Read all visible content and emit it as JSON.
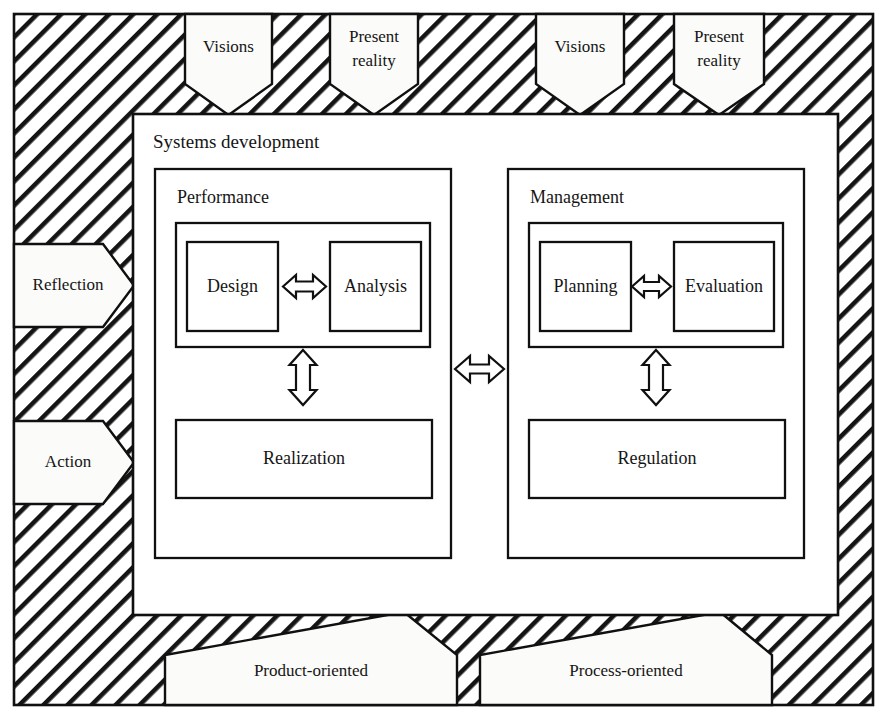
{
  "diagram": {
    "title": "Systems development",
    "outer_frame": {
      "name": "hatched-context-frame"
    },
    "columns": [
      {
        "heading": "Performance",
        "pair": {
          "left": "Design",
          "right": "Analysis"
        },
        "lower": "Realization",
        "bottom_arrow": "Product-oriented"
      },
      {
        "heading": "Management",
        "pair": {
          "left": "Planning",
          "right": "Evaluation"
        },
        "lower": "Regulation",
        "bottom_arrow": "Process-oriented"
      }
    ],
    "top_arrows": [
      {
        "label": "Visions",
        "lines": [
          "Visions"
        ]
      },
      {
        "label": "Present reality",
        "lines": [
          "Present",
          "reality"
        ]
      },
      {
        "label": "Visions",
        "lines": [
          "Visions"
        ]
      },
      {
        "label": "Present reality",
        "lines": [
          "Present",
          "reality"
        ]
      }
    ],
    "left_arrows": [
      {
        "label": "Reflection"
      },
      {
        "label": "Action"
      }
    ],
    "bottom_arrows": [
      {
        "label": "Product-oriented"
      },
      {
        "label": "Process-oriented"
      }
    ],
    "connectors": [
      {
        "name": "design-analysis",
        "orientation": "horizontal"
      },
      {
        "name": "planning-evaluation",
        "orientation": "horizontal"
      },
      {
        "name": "performance-vertical",
        "orientation": "vertical"
      },
      {
        "name": "management-vertical",
        "orientation": "vertical"
      },
      {
        "name": "performance-management",
        "orientation": "horizontal"
      }
    ],
    "colors": {
      "ink": "#101010",
      "paper": "#ffffff",
      "hatch": "#141414"
    }
  }
}
